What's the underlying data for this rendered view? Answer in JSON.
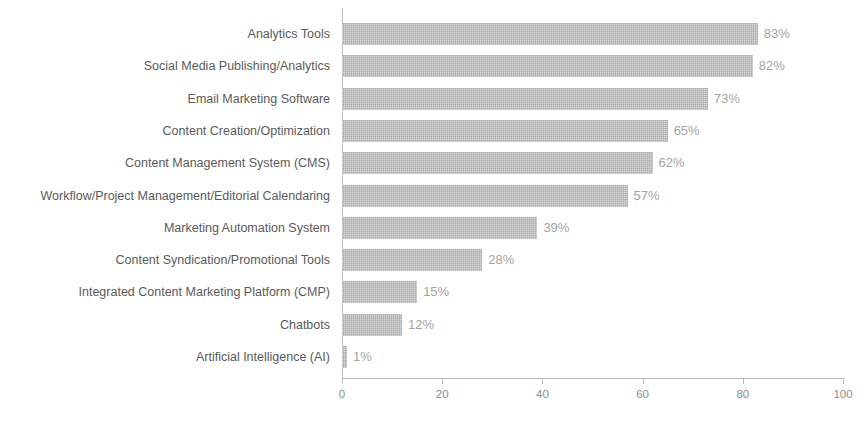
{
  "chart_data": {
    "type": "bar",
    "orientation": "horizontal",
    "title": "",
    "subtitle": "",
    "xlabel": "",
    "ylabel": "",
    "xlim": [
      0,
      100
    ],
    "xticks": [
      "0",
      "20",
      "40",
      "60",
      "80",
      "100"
    ],
    "xtick_values": [
      0,
      20,
      40,
      60,
      80,
      100
    ],
    "grid": false,
    "legend": false,
    "value_suffix": "%",
    "categories": [
      "Analytics Tools",
      "Social Media Publishing/Analytics",
      "Email Marketing Software",
      "Content Creation/Optimization",
      "Content Management System (CMS)",
      "Workflow/Project Management/Editorial Calendaring",
      "Marketing Automation System",
      "Content Syndication/Promotional Tools",
      "Integrated Content Marketing Platform (CMP)",
      "Chatbots",
      "Artificial Intelligence (AI)"
    ],
    "values": [
      83,
      82,
      73,
      65,
      62,
      57,
      39,
      28,
      15,
      12,
      1
    ],
    "value_labels": [
      "83%",
      "82%",
      "73%",
      "65%",
      "62%",
      "57%",
      "39%",
      "28%",
      "15%",
      "12%",
      "1%"
    ],
    "colors": {
      "bar": "#a9a9a9",
      "category_label": "#5a5a5a",
      "value_label": "#a3a3a3",
      "axis": "#bcbcbc",
      "tick_label": "#8d8d8d",
      "background": "#ffffff"
    }
  }
}
